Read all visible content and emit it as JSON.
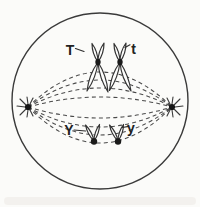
{
  "figure": {
    "labels": {
      "allele_top_left": "T",
      "allele_top_right": "t",
      "allele_bottom_left": "Y",
      "allele_bottom_right": "y"
    },
    "colors": {
      "line": "#3a3a3a",
      "background": "#fbfbf9",
      "chromatid_fill": "#fdfdfc",
      "centromere": "#1a1a1a"
    }
  }
}
